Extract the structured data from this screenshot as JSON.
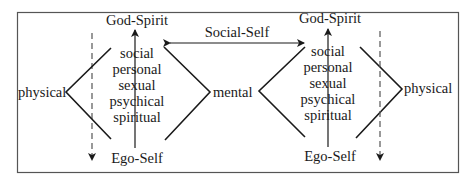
{
  "diagram": {
    "left_panel": {
      "top_label": "God-Spirit",
      "bottom_label": "Ego-Self",
      "outer_label": "physical",
      "levels": [
        "social",
        "personal",
        "sexual",
        "psychical",
        "spiritual"
      ]
    },
    "middle_label": "mental",
    "connector_label": "Social-Self",
    "right_panel": {
      "top_label": "God-Spirit",
      "bottom_label": "Ego-Self",
      "outer_label": "physical",
      "levels": [
        "social",
        "personal",
        "sexual",
        "psychical",
        "spiritual"
      ]
    },
    "colors": {
      "line": "#1a1a1a",
      "border": "#555555",
      "dashed": "#555555",
      "background": "#ffffff"
    }
  }
}
